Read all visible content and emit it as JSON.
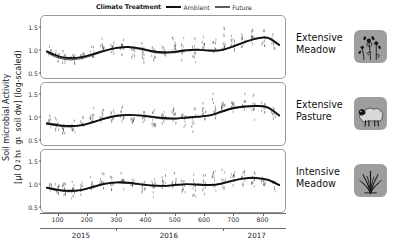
{
  "legend": {
    "title": "Climate Treatment",
    "entries": [
      {
        "label": "Ambient",
        "color": "#111111",
        "width": 2.4
      },
      {
        "label": "Future",
        "color": "#5d5d5d",
        "width": 1.5
      }
    ]
  },
  "axis": {
    "ylabel_line1": "Soil microbial Activity",
    "ylabel_line2_prefix": "[µl O",
    "ylabel_o2_sub": "2",
    "ylabel_h": " h",
    "ylabel_h_sup": "-1",
    "ylabel_g": " g",
    "ylabel_g_sup": "-1",
    "ylabel_tail": " soil dw] (log-scaled)",
    "yticks": [
      0.5,
      1.0,
      1.5
    ],
    "ytick_labels": [
      "0.5",
      "1.0",
      "1.5"
    ],
    "ylim": [
      0.35,
      1.75
    ],
    "xticks": [
      100,
      200,
      300,
      400,
      500,
      600,
      700,
      800
    ],
    "xtick_labels": [
      "100",
      "200",
      "300",
      "400",
      "500",
      "600",
      "700",
      "800"
    ],
    "xlim": [
      40,
      880
    ],
    "year_ticks": [
      {
        "label": "2015",
        "center": 180,
        "boundary": 300
      },
      {
        "label": "2016",
        "center": 480,
        "boundary": 665
      },
      {
        "label": "2017",
        "center": 780,
        "boundary": null
      }
    ]
  },
  "panels": [
    {
      "id": "extensive-meadow",
      "label_line1": "Extensive",
      "label_line2": "Meadow",
      "icon": "wildflower-icon"
    },
    {
      "id": "extensive-pasture",
      "label_line1": "Extensive",
      "label_line2": "Pasture",
      "icon": "sheep-icon"
    },
    {
      "id": "intensive-meadow",
      "label_line1": "Intensive",
      "label_line2": "Meadow",
      "icon": "grass-icon"
    }
  ],
  "chart_data": {
    "type": "line",
    "title": "",
    "xlabel": "",
    "ylabel": "Soil microbial Activity [µl O2 h-1 g-1 soil dw] (log-scaled)",
    "xlim": [
      40,
      880
    ],
    "ylim": [
      0.35,
      1.75
    ],
    "grid": false,
    "legend_position": "top",
    "panels": [
      {
        "name": "Extensive Meadow",
        "series": [
          {
            "name": "Ambient",
            "color": "#111111",
            "x": [
              60,
              100,
              140,
              180,
              220,
              260,
              300,
              340,
              380,
              420,
              460,
              500,
              540,
              580,
              620,
              660,
              700,
              740,
              780,
              820,
              860
            ],
            "values": [
              0.95,
              0.84,
              0.8,
              0.82,
              0.89,
              0.97,
              1.03,
              1.05,
              1.02,
              0.96,
              0.93,
              0.94,
              0.98,
              0.99,
              0.97,
              0.98,
              1.06,
              1.16,
              1.24,
              1.26,
              1.1
            ]
          },
          {
            "name": "Future",
            "color": "#5d5d5d",
            "x": [
              60,
              100,
              140,
              180,
              220,
              260,
              300,
              340,
              380,
              420,
              460,
              500,
              540,
              580,
              620,
              660,
              700,
              740,
              780,
              820,
              860
            ],
            "values": [
              0.93,
              0.8,
              0.76,
              0.79,
              0.87,
              0.96,
              1.02,
              1.04,
              1.0,
              0.94,
              0.91,
              0.92,
              0.96,
              0.98,
              0.96,
              0.97,
              1.05,
              1.15,
              1.23,
              1.25,
              1.08
            ]
          }
        ],
        "scatter_clusters": [
          {
            "x": 72,
            "mean": 0.96,
            "spread": 0.14,
            "n": 8
          },
          {
            "x": 96,
            "mean": 0.84,
            "spread": 0.16,
            "n": 10
          },
          {
            "x": 120,
            "mean": 0.79,
            "spread": 0.15,
            "n": 9
          },
          {
            "x": 150,
            "mean": 0.8,
            "spread": 0.13,
            "n": 8
          },
          {
            "x": 182,
            "mean": 0.86,
            "spread": 0.14,
            "n": 9
          },
          {
            "x": 216,
            "mean": 0.97,
            "spread": 0.17,
            "n": 10
          },
          {
            "x": 250,
            "mean": 1.05,
            "spread": 0.22,
            "n": 10
          },
          {
            "x": 286,
            "mean": 1.03,
            "spread": 0.16,
            "n": 9
          },
          {
            "x": 320,
            "mean": 1.04,
            "spread": 0.18,
            "n": 9
          },
          {
            "x": 356,
            "mean": 0.97,
            "spread": 0.19,
            "n": 9
          },
          {
            "x": 392,
            "mean": 0.93,
            "spread": 0.22,
            "n": 10
          },
          {
            "x": 428,
            "mean": 0.92,
            "spread": 0.25,
            "n": 10
          },
          {
            "x": 462,
            "mean": 0.96,
            "spread": 0.17,
            "n": 9
          },
          {
            "x": 498,
            "mean": 1.06,
            "spread": 0.3,
            "n": 11
          },
          {
            "x": 530,
            "mean": 1.0,
            "spread": 0.24,
            "n": 10
          },
          {
            "x": 566,
            "mean": 0.98,
            "spread": 0.26,
            "n": 10
          },
          {
            "x": 600,
            "mean": 1.12,
            "spread": 0.28,
            "n": 9
          },
          {
            "x": 636,
            "mean": 1.05,
            "spread": 0.22,
            "n": 9
          },
          {
            "x": 668,
            "mean": 1.2,
            "spread": 0.3,
            "n": 11
          },
          {
            "x": 700,
            "mean": 1.13,
            "spread": 0.24,
            "n": 10
          },
          {
            "x": 736,
            "mean": 1.22,
            "spread": 0.2,
            "n": 9
          },
          {
            "x": 770,
            "mean": 1.26,
            "spread": 0.28,
            "n": 11
          },
          {
            "x": 806,
            "mean": 1.24,
            "spread": 0.26,
            "n": 10
          },
          {
            "x": 840,
            "mean": 1.12,
            "spread": 0.22,
            "n": 8
          }
        ]
      },
      {
        "name": "Extensive Pasture",
        "series": [
          {
            "name": "Ambient",
            "color": "#111111",
            "x": [
              60,
              100,
              140,
              180,
              220,
              260,
              300,
              340,
              380,
              420,
              460,
              500,
              540,
              580,
              620,
              660,
              700,
              740,
              780,
              820,
              860
            ],
            "values": [
              0.84,
              0.8,
              0.78,
              0.8,
              0.87,
              0.95,
              1.01,
              1.03,
              1.02,
              0.99,
              0.96,
              0.95,
              0.97,
              0.99,
              1.02,
              1.1,
              1.18,
              1.22,
              1.23,
              1.2,
              1.02
            ]
          },
          {
            "name": "Future",
            "color": "#5d5d5d",
            "x": [
              60,
              100,
              140,
              180,
              220,
              260,
              300,
              340,
              380,
              420,
              460,
              500,
              540,
              580,
              620,
              660,
              700,
              740,
              780,
              820,
              860
            ],
            "values": [
              0.82,
              0.78,
              0.76,
              0.79,
              0.86,
              0.94,
              1.0,
              1.02,
              1.01,
              0.97,
              0.94,
              0.94,
              0.96,
              0.98,
              1.01,
              1.09,
              1.17,
              1.21,
              1.22,
              1.19,
              1.0
            ]
          }
        ],
        "scatter_clusters": [
          {
            "x": 72,
            "mean": 0.86,
            "spread": 0.14,
            "n": 8
          },
          {
            "x": 96,
            "mean": 0.8,
            "spread": 0.16,
            "n": 10
          },
          {
            "x": 120,
            "mean": 0.76,
            "spread": 0.18,
            "n": 10
          },
          {
            "x": 150,
            "mean": 0.77,
            "spread": 0.15,
            "n": 9
          },
          {
            "x": 182,
            "mean": 0.85,
            "spread": 0.15,
            "n": 9
          },
          {
            "x": 216,
            "mean": 0.96,
            "spread": 0.18,
            "n": 10
          },
          {
            "x": 250,
            "mean": 1.03,
            "spread": 0.24,
            "n": 10
          },
          {
            "x": 286,
            "mean": 1.02,
            "spread": 0.16,
            "n": 9
          },
          {
            "x": 320,
            "mean": 1.06,
            "spread": 0.22,
            "n": 10
          },
          {
            "x": 356,
            "mean": 0.98,
            "spread": 0.18,
            "n": 9
          },
          {
            "x": 392,
            "mean": 0.96,
            "spread": 0.2,
            "n": 10
          },
          {
            "x": 428,
            "mean": 0.92,
            "spread": 0.28,
            "n": 11
          },
          {
            "x": 462,
            "mean": 0.98,
            "spread": 0.2,
            "n": 9
          },
          {
            "x": 498,
            "mean": 1.04,
            "spread": 0.24,
            "n": 10
          },
          {
            "x": 530,
            "mean": 0.98,
            "spread": 0.22,
            "n": 10
          },
          {
            "x": 566,
            "mean": 0.96,
            "spread": 0.28,
            "n": 11
          },
          {
            "x": 600,
            "mean": 1.08,
            "spread": 0.26,
            "n": 10
          },
          {
            "x": 636,
            "mean": 1.18,
            "spread": 0.3,
            "n": 11
          },
          {
            "x": 668,
            "mean": 1.2,
            "spread": 0.26,
            "n": 10
          },
          {
            "x": 700,
            "mean": 1.22,
            "spread": 0.24,
            "n": 10
          },
          {
            "x": 736,
            "mean": 1.24,
            "spread": 0.22,
            "n": 9
          },
          {
            "x": 770,
            "mean": 1.22,
            "spread": 0.24,
            "n": 10
          },
          {
            "x": 806,
            "mean": 1.18,
            "spread": 0.22,
            "n": 9
          },
          {
            "x": 840,
            "mean": 1.04,
            "spread": 0.2,
            "n": 8
          }
        ]
      },
      {
        "name": "Intensive Meadow",
        "series": [
          {
            "name": "Ambient",
            "color": "#111111",
            "x": [
              60,
              100,
              140,
              180,
              220,
              260,
              300,
              340,
              380,
              420,
              460,
              500,
              540,
              580,
              620,
              660,
              700,
              740,
              780,
              820,
              860
            ],
            "values": [
              0.9,
              0.85,
              0.83,
              0.85,
              0.92,
              0.99,
              1.02,
              1.01,
              0.98,
              0.95,
              0.94,
              0.96,
              0.98,
              0.97,
              0.96,
              0.99,
              1.06,
              1.11,
              1.12,
              1.08,
              0.96
            ]
          },
          {
            "name": "Future",
            "color": "#5d5d5d",
            "x": [
              60,
              100,
              140,
              180,
              220,
              260,
              300,
              340,
              380,
              420,
              460,
              500,
              540,
              580,
              620,
              660,
              700,
              740,
              780,
              820,
              860
            ],
            "values": [
              0.89,
              0.83,
              0.81,
              0.84,
              0.91,
              0.98,
              1.01,
              1.0,
              0.97,
              0.94,
              0.93,
              0.95,
              0.97,
              0.96,
              0.95,
              0.98,
              1.05,
              1.1,
              1.11,
              1.07,
              0.95
            ]
          }
        ],
        "scatter_clusters": [
          {
            "x": 72,
            "mean": 0.92,
            "spread": 0.12,
            "n": 8
          },
          {
            "x": 96,
            "mean": 0.86,
            "spread": 0.16,
            "n": 10
          },
          {
            "x": 120,
            "mean": 0.82,
            "spread": 0.22,
            "n": 11
          },
          {
            "x": 150,
            "mean": 0.83,
            "spread": 0.2,
            "n": 10
          },
          {
            "x": 182,
            "mean": 0.9,
            "spread": 0.16,
            "n": 9
          },
          {
            "x": 216,
            "mean": 1.0,
            "spread": 0.2,
            "n": 10
          },
          {
            "x": 250,
            "mean": 1.04,
            "spread": 0.24,
            "n": 10
          },
          {
            "x": 286,
            "mean": 1.0,
            "spread": 0.18,
            "n": 9
          },
          {
            "x": 320,
            "mean": 1.02,
            "spread": 0.2,
            "n": 10
          },
          {
            "x": 356,
            "mean": 0.96,
            "spread": 0.18,
            "n": 9
          },
          {
            "x": 392,
            "mean": 0.94,
            "spread": 0.22,
            "n": 10
          },
          {
            "x": 428,
            "mean": 0.92,
            "spread": 0.28,
            "n": 11
          },
          {
            "x": 462,
            "mean": 1.0,
            "spread": 0.22,
            "n": 10
          },
          {
            "x": 498,
            "mean": 1.02,
            "spread": 0.24,
            "n": 10
          },
          {
            "x": 530,
            "mean": 0.96,
            "spread": 0.26,
            "n": 11
          },
          {
            "x": 566,
            "mean": 0.94,
            "spread": 0.28,
            "n": 11
          },
          {
            "x": 600,
            "mean": 1.02,
            "spread": 0.24,
            "n": 10
          },
          {
            "x": 636,
            "mean": 1.08,
            "spread": 0.3,
            "n": 11
          },
          {
            "x": 668,
            "mean": 1.1,
            "spread": 0.26,
            "n": 10
          },
          {
            "x": 700,
            "mean": 1.12,
            "spread": 0.22,
            "n": 10
          },
          {
            "x": 736,
            "mean": 1.14,
            "spread": 0.24,
            "n": 10
          },
          {
            "x": 770,
            "mean": 1.1,
            "spread": 0.26,
            "n": 10
          },
          {
            "x": 806,
            "mean": 1.04,
            "spread": 0.22,
            "n": 9
          },
          {
            "x": 840,
            "mean": 0.96,
            "spread": 0.18,
            "n": 8
          }
        ]
      }
    ]
  }
}
